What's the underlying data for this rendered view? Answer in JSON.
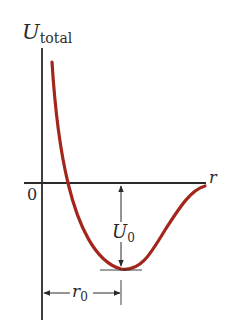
{
  "diagram": {
    "y_axis_label_main": "U",
    "y_axis_label_sub": "total",
    "x_axis_label": "r",
    "origin_label": "0",
    "well_depth_label_main": "U",
    "well_depth_label_sub": "0",
    "equilibrium_label_main": "r",
    "equilibrium_label_sub": "0",
    "colors": {
      "curve": "#a3261c",
      "axes": "#2a2a2a",
      "background": "#ffffff"
    }
  }
}
